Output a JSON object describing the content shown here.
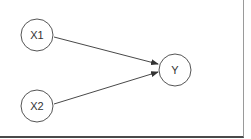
{
  "diagram": {
    "type": "directed-graph",
    "nodes": [
      {
        "id": "X1",
        "label": "X1",
        "cx": 37,
        "cy": 35,
        "r": 16
      },
      {
        "id": "X2",
        "label": "X2",
        "cx": 37,
        "cy": 106,
        "r": 16
      },
      {
        "id": "Y",
        "label": "Y",
        "cx": 175,
        "cy": 70,
        "r": 16
      }
    ],
    "edges": [
      {
        "from": "X1",
        "to": "Y"
      },
      {
        "from": "X2",
        "to": "Y"
      }
    ],
    "colors": {
      "node_stroke": "#555555",
      "edge": "#333333",
      "background": "#ffffff"
    }
  }
}
